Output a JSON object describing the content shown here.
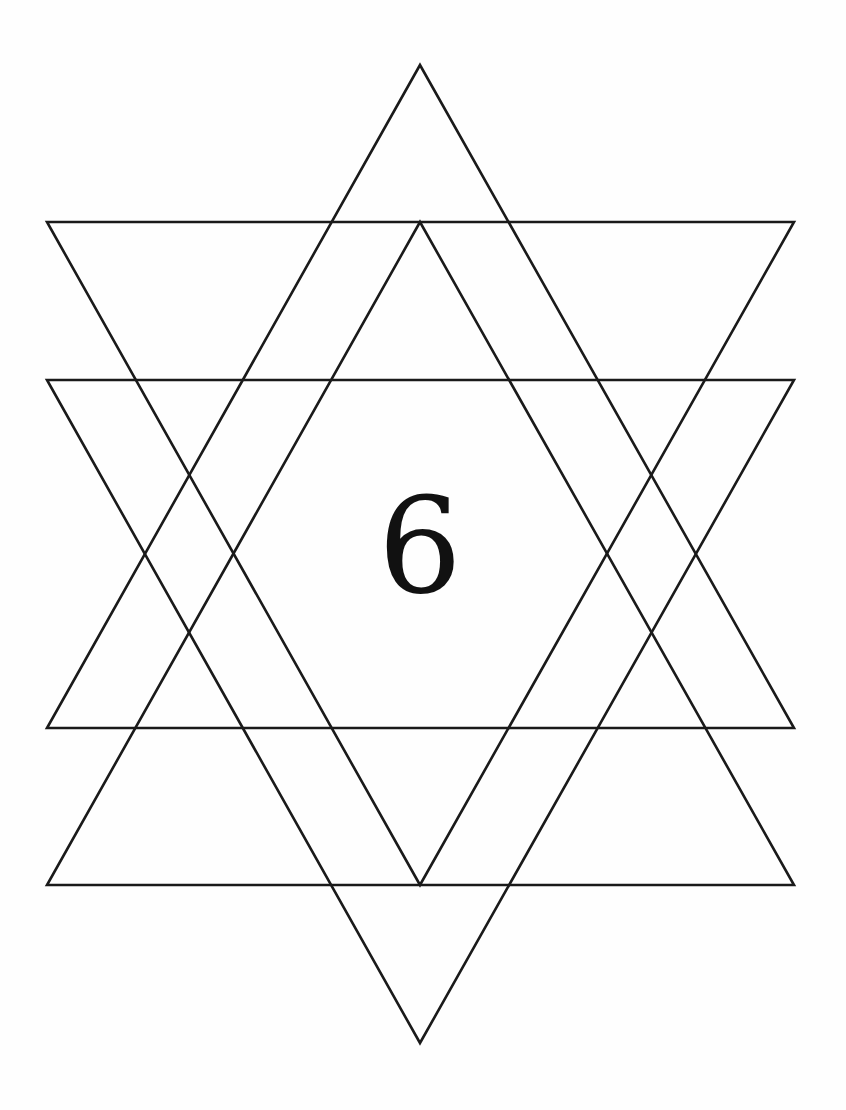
{
  "diagram": {
    "label": "6",
    "stroke_color": "#1a1a1a",
    "background": "#fefefe",
    "triangles": [
      {
        "name": "up-large",
        "points": "420,65 47,728 794,728"
      },
      {
        "name": "up-inner",
        "points": "420,222 47,885 794,885"
      },
      {
        "name": "down-upper",
        "points": "47,222 794,222 420,885"
      },
      {
        "name": "down-lower",
        "points": "47,380 794,380 420,1043"
      }
    ]
  }
}
